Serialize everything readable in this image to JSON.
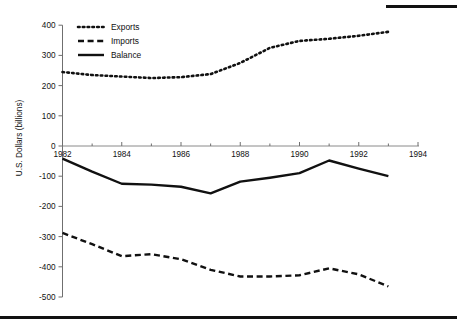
{
  "figure": {
    "decorations": {
      "top_rule": "black-rule",
      "bottom_rule": "black-rule"
    }
  },
  "chart_data": {
    "type": "line",
    "title": "",
    "subtitle": "",
    "xlabel": "",
    "ylabel": "U.S. Dollars (billions)",
    "xlim": [
      1982,
      1994
    ],
    "ylim": [
      -500,
      400
    ],
    "yticks": [
      400,
      300,
      200,
      100,
      0,
      -100,
      -200,
      -300,
      -400,
      -500
    ],
    "ytick_labels": [
      "400",
      "300",
      "200",
      "100",
      "0",
      "-100",
      "-200",
      "-300",
      "-400",
      "-500"
    ],
    "xticks": [
      1982,
      1984,
      1986,
      1988,
      1990,
      1992,
      1994
    ],
    "xtick_labels": [
      "1982",
      "1984",
      "1986",
      "1988",
      "1990",
      "1992",
      "1994"
    ],
    "xminor_ticks": [
      1983,
      1985,
      1987,
      1989,
      1991,
      1993
    ],
    "grid": false,
    "legend_position": "top-left",
    "x": [
      1982,
      1983,
      1984,
      1985,
      1986,
      1987,
      1988,
      1989,
      1990,
      1991,
      1992,
      1993
    ],
    "series": [
      {
        "name": "Exports",
        "style": "dotted",
        "values": [
          245,
          235,
          230,
          225,
          228,
          238,
          275,
          325,
          348,
          355,
          365,
          378
        ]
      },
      {
        "name": "Imports",
        "style": "dashed",
        "values": [
          -288,
          -325,
          -365,
          -358,
          -375,
          -410,
          -432,
          -432,
          -428,
          -405,
          -425,
          -465
        ]
      },
      {
        "name": "Balance",
        "style": "solid",
        "values": [
          -42,
          -85,
          -125,
          -128,
          -135,
          -157,
          -118,
          -105,
          -90,
          -48,
          -75,
          -100
        ]
      }
    ]
  },
  "legend": {
    "items": [
      {
        "label": "Exports",
        "style": "dotted"
      },
      {
        "label": "Imports",
        "style": "dashed"
      },
      {
        "label": "Balance",
        "style": "solid"
      }
    ]
  }
}
